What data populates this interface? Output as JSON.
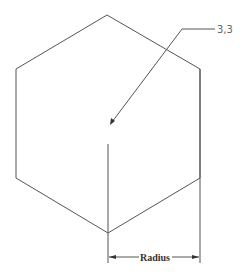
{
  "diagram": {
    "shape": "hexagon",
    "leader_label": "3,3",
    "dimension_label": "Radius",
    "colors": {
      "line": "#555555",
      "background": "#ffffff"
    },
    "vertices": [
      [
        107,
        15
      ],
      [
        200,
        69
      ],
      [
        200,
        178
      ],
      [
        108,
        233
      ],
      [
        16,
        178
      ],
      [
        16,
        69
      ]
    ],
    "center": [
      108,
      144
    ]
  }
}
